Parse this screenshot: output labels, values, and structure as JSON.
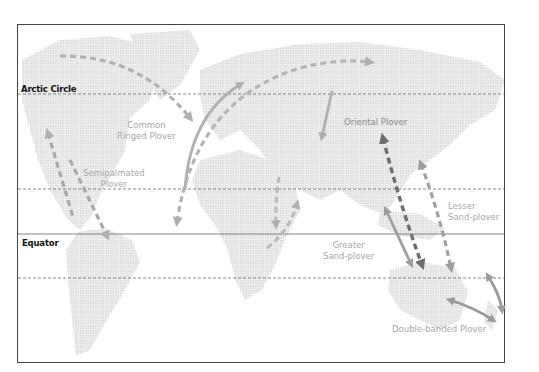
{
  "map": {
    "title": "Plover migration routes",
    "frame": {
      "border_color": "#444444"
    },
    "land_color": "#e6e6e6",
    "reference_lines": [
      {
        "id": "arctic_circle",
        "label": "Arctic Circle",
        "style": "dashed"
      },
      {
        "id": "tropic_of_cancer",
        "label": "",
        "style": "dashed"
      },
      {
        "id": "equator",
        "label": "Equator",
        "style": "solid"
      },
      {
        "id": "tropic_of_capricorn",
        "label": "",
        "style": "dashed"
      }
    ],
    "species": [
      {
        "id": "common_ringed_plover",
        "label_line1": "Common",
        "label_line2": "Ringed Plover",
        "arrow_color": "#b0b0b0"
      },
      {
        "id": "semipalmated_plover",
        "label_line1": "Semipalmated",
        "label_line2": "Plover",
        "arrow_color": "#a8a8a8"
      },
      {
        "id": "oriental_plover",
        "label_line1": "Oriental Plover",
        "label_line2": "",
        "arrow_color": "#707070"
      },
      {
        "id": "lesser_sand_plover",
        "label_line1": "Lesser",
        "label_line2": "Sand-plover",
        "arrow_color": "#a0a0a0"
      },
      {
        "id": "greater_sand_plover",
        "label_line1": "Greater",
        "label_line2": "Sand-plover",
        "arrow_color": "#b8b8b8"
      },
      {
        "id": "double_banded_plover",
        "label_line1": "Double-banded Plover",
        "label_line2": "",
        "arrow_color": "#9a9a9a"
      }
    ]
  }
}
